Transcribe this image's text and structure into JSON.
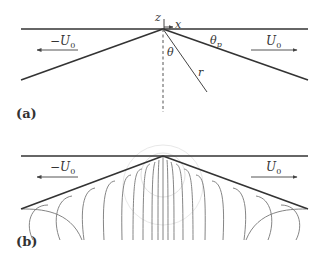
{
  "figure": {
    "panel_a": {
      "label": "(a)",
      "axis_z": "z",
      "axis_x": "x",
      "left_velocity": "−U",
      "left_velocity_sub": "0",
      "right_velocity": "U",
      "right_velocity_sub": "0",
      "angle_plate": "θ",
      "angle_plate_sub": "p",
      "angle_theta": "θ",
      "radius": "r"
    },
    "panel_b": {
      "label": "(b)",
      "left_velocity": "−U",
      "left_velocity_sub": "0",
      "right_velocity": "U",
      "right_velocity_sub": "0"
    },
    "colors": {
      "lines": "#333333",
      "streamlines": "#777777",
      "circles": "#dddddd"
    }
  }
}
